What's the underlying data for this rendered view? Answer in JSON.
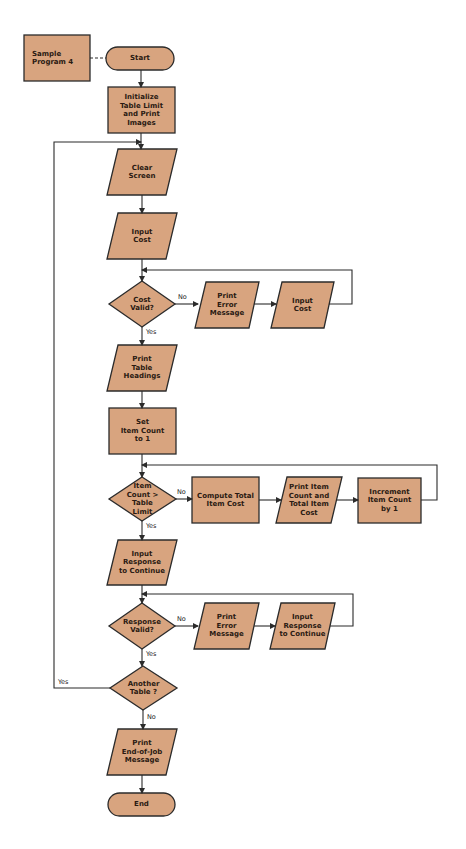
{
  "colors": {
    "fill": "#d8a47f",
    "stroke": "#2b2b2b",
    "text": "#2a1a12",
    "background": "#ffffff"
  },
  "nodes": {
    "sample_program": "Sample\nProgram 4",
    "start": "Start",
    "initialize": "Initialize\nTable Limit\nand Print\nImages",
    "clear_screen": "Clear\nScreen",
    "input_cost": "Input\nCost",
    "cost_valid": "Cost\nValid?",
    "print_error_1": "Print\nError\nMessage",
    "input_cost_2": "Input\nCost",
    "print_headings": "Print\nTable\nHeadings",
    "set_item_count": "Set\nItem Count\nto 1",
    "item_count_check": "Item\nCount  >\nTable\nLimit",
    "compute_total": "Compute Total\nItem Cost",
    "print_item_count": "Print Item\nCount and\nTotal Item\nCost",
    "increment": "Increment\nItem Count\nby 1",
    "input_response": "Input\nResponse\nto Continue",
    "response_valid": "Response\nValid?",
    "print_error_2": "Print\nError\nMessage",
    "input_response_2": "Input\nResponse\nto Continue",
    "another_table": "Another\nTable ?",
    "print_end": "Print\nEnd-of-Job\nMessage",
    "end": "End"
  },
  "edge_labels": {
    "cost_no": "No",
    "cost_yes": "Yes",
    "item_no": "No",
    "item_yes": "Yes",
    "response_no": "No",
    "response_yes": "Yes",
    "another_yes": "Yes",
    "another_no": "No"
  }
}
